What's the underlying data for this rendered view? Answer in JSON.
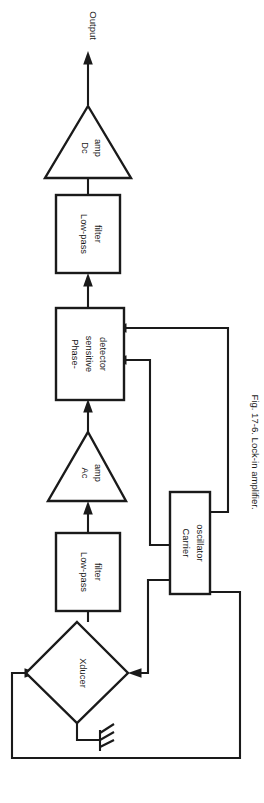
{
  "figure": {
    "caption": "Fig. 17-6. Lock-in amplifier.",
    "orientation": "rotated-90-ccw",
    "background_color": "#ffffff",
    "ink_color": "#1a1a1a"
  },
  "diagram": {
    "type": "block-diagram",
    "title": "Lock-in amplifier",
    "signal_flow": "Xducer -> Low-pass filter -> Ac amp -> Phase-sensitive detector -> Low-pass filter -> Dc amp -> Output",
    "output_label": "Output",
    "blocks": [
      {
        "id": "dc-amp",
        "shape": "triangle",
        "line1": "Dc",
        "line2": "amp"
      },
      {
        "id": "low-pass-filter-2",
        "shape": "rectangle",
        "line1": "Low-pass",
        "line2": "filter"
      },
      {
        "id": "phase-sensitive-detector",
        "shape": "rectangle",
        "line1": "Phase-",
        "line2": "sensitive",
        "line3": "detector"
      },
      {
        "id": "ac-amp",
        "shape": "triangle",
        "line1": "Ac",
        "line2": "amp"
      },
      {
        "id": "low-pass-filter-1",
        "shape": "rectangle",
        "line1": "Low-pass",
        "line2": "filter"
      },
      {
        "id": "carrier-oscillator",
        "shape": "rectangle",
        "line1": "Carrier",
        "line2": "oscillator"
      },
      {
        "id": "xducer",
        "shape": "diamond",
        "line1": "Xducer"
      }
    ],
    "symbols": [
      {
        "id": "ground",
        "name": "ground-symbol"
      }
    ]
  }
}
